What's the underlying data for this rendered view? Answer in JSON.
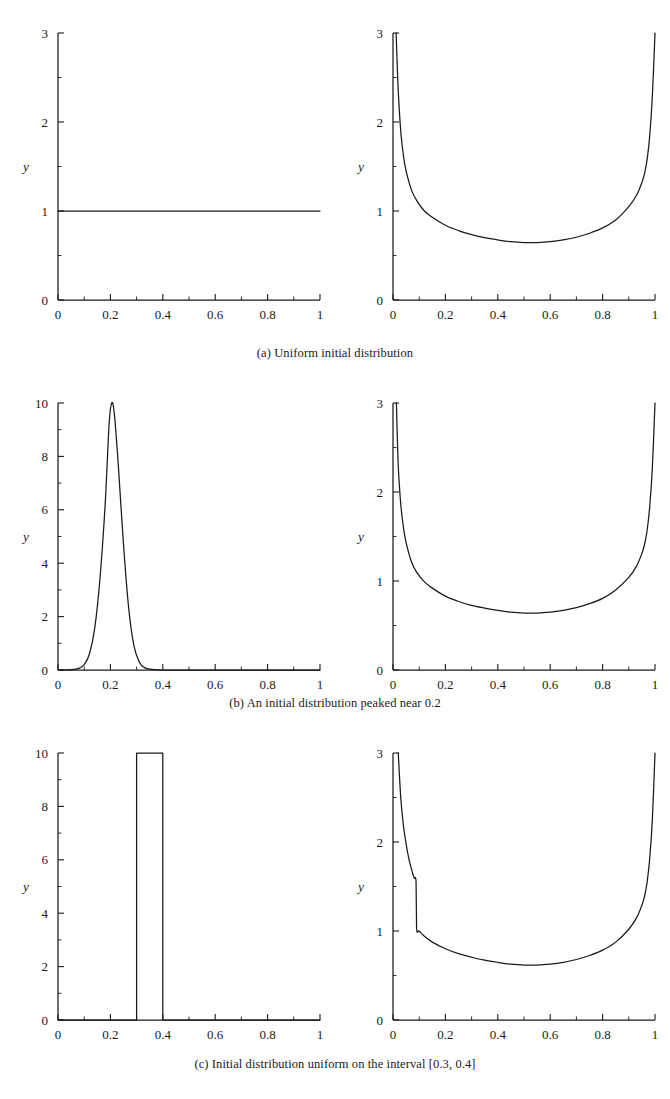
{
  "figure": {
    "axis_label_x": "x",
    "axis_label_y": "y",
    "rows": [
      {
        "id": "a",
        "caption": "(a) Uniform initial distribution"
      },
      {
        "id": "b",
        "caption": "(b) An initial distribution peaked near 0.2"
      },
      {
        "id": "c",
        "caption": "(c) Initial distribution uniform on the interval [0.3, 0.4]"
      }
    ]
  },
  "chart_data": [
    {
      "type": "line",
      "panel": "a-left",
      "title": "",
      "xlabel": "x",
      "ylabel": "y",
      "xlim": [
        0,
        1
      ],
      "ylim": [
        0,
        3
      ],
      "xticks": [
        0,
        0.2,
        0.4,
        0.6,
        0.8,
        1
      ],
      "xtick_labels": [
        "0",
        "0.2",
        "0.4",
        "0.6",
        "0.8",
        "1"
      ],
      "yticks": [
        0,
        1,
        2,
        3
      ],
      "ytick_labels": [
        "0",
        "1",
        "2",
        "3"
      ],
      "x_minor_step": 0.1,
      "y_minor_step": 0.5,
      "grid": false,
      "legend": "none",
      "series": [
        {
          "name": "uniform initial density",
          "x": [
            0,
            0.1,
            0.2,
            0.3,
            0.4,
            0.5,
            0.6,
            0.7,
            0.8,
            0.9,
            1
          ],
          "values": [
            1,
            1,
            1,
            1,
            1,
            1,
            1,
            1,
            1,
            1,
            1
          ]
        }
      ]
    },
    {
      "type": "line",
      "panel": "a-right",
      "title": "",
      "xlabel": "x",
      "ylabel": "y",
      "xlim": [
        0,
        1
      ],
      "ylim": [
        0,
        3
      ],
      "xticks": [
        0,
        0.2,
        0.4,
        0.6,
        0.8,
        1
      ],
      "xtick_labels": [
        "0",
        "0.2",
        "0.4",
        "0.6",
        "0.8",
        "1"
      ],
      "yticks": [
        0,
        1,
        2,
        3
      ],
      "ytick_labels": [
        "0",
        "1",
        "2",
        "3"
      ],
      "x_minor_step": 0.1,
      "y_minor_step": 0.5,
      "grid": false,
      "legend": "none",
      "series": [
        {
          "name": "limiting arcsine-type density",
          "x": [
            0.012,
            0.02,
            0.03,
            0.04,
            0.05,
            0.07,
            0.09,
            0.12,
            0.15,
            0.2,
            0.25,
            0.3,
            0.35,
            0.4,
            0.45,
            0.5,
            0.55,
            0.6,
            0.65,
            0.7,
            0.75,
            0.8,
            0.85,
            0.9,
            0.93,
            0.95,
            0.96,
            0.97,
            0.98,
            0.99,
            1.0
          ],
          "values": [
            3.0,
            2.35,
            1.88,
            1.62,
            1.45,
            1.24,
            1.12,
            1.0,
            0.93,
            0.84,
            0.78,
            0.735,
            0.7,
            0.675,
            0.655,
            0.645,
            0.645,
            0.655,
            0.675,
            0.705,
            0.75,
            0.81,
            0.9,
            1.05,
            1.18,
            1.32,
            1.42,
            1.58,
            1.85,
            2.3,
            3.0
          ]
        }
      ]
    },
    {
      "type": "line",
      "panel": "b-left",
      "title": "",
      "xlabel": "x",
      "ylabel": "y",
      "xlim": [
        0,
        1
      ],
      "ylim": [
        0,
        10
      ],
      "xticks": [
        0,
        0.2,
        0.4,
        0.6,
        0.8,
        1
      ],
      "xtick_labels": [
        "0",
        "0.2",
        "0.4",
        "0.6",
        "0.8",
        "1"
      ],
      "yticks": [
        0,
        2,
        4,
        6,
        8,
        10
      ],
      "ytick_labels": [
        "0",
        "2",
        "4",
        "6",
        "8",
        "10"
      ],
      "x_minor_step": 0.1,
      "y_minor_step": 1,
      "grid": false,
      "legend": "none",
      "peak_center": 0.205,
      "peak_height": 10,
      "peak_sigma": 0.04,
      "series": [
        {
          "name": "initial density peaked near 0.2",
          "x": [
            0,
            0.05,
            0.08,
            0.1,
            0.12,
            0.14,
            0.16,
            0.18,
            0.195,
            0.205,
            0.215,
            0.23,
            0.25,
            0.27,
            0.29,
            0.31,
            0.33,
            0.36,
            0.4,
            0.5,
            0.7,
            1.0
          ],
          "values": [
            0,
            0.01,
            0.06,
            0.2,
            0.6,
            1.55,
            3.4,
            6.2,
            9.2,
            10.0,
            9.6,
            7.7,
            4.7,
            2.3,
            0.9,
            0.3,
            0.09,
            0.02,
            0.0,
            0.0,
            0.0,
            0.0
          ]
        }
      ]
    },
    {
      "type": "line",
      "panel": "b-right",
      "title": "",
      "xlabel": "x",
      "ylabel": "y",
      "xlim": [
        0,
        1
      ],
      "ylim": [
        0,
        3
      ],
      "xticks": [
        0,
        0.2,
        0.4,
        0.6,
        0.8,
        1
      ],
      "xtick_labels": [
        "0",
        "0.2",
        "0.4",
        "0.6",
        "0.8",
        "1"
      ],
      "yticks": [
        0,
        1,
        2,
        3
      ],
      "ytick_labels": [
        "0",
        "1",
        "2",
        "3"
      ],
      "x_minor_step": 0.1,
      "y_minor_step": 0.5,
      "grid": false,
      "legend": "none",
      "series": [
        {
          "name": "limiting arcsine-type density",
          "x": [
            0.013,
            0.02,
            0.03,
            0.04,
            0.05,
            0.07,
            0.09,
            0.12,
            0.15,
            0.2,
            0.25,
            0.3,
            0.35,
            0.4,
            0.45,
            0.5,
            0.55,
            0.6,
            0.65,
            0.7,
            0.75,
            0.8,
            0.85,
            0.9,
            0.93,
            0.95,
            0.96,
            0.97,
            0.98,
            0.99,
            1.0
          ],
          "values": [
            3.0,
            2.3,
            1.85,
            1.6,
            1.43,
            1.22,
            1.1,
            0.99,
            0.92,
            0.83,
            0.77,
            0.725,
            0.695,
            0.67,
            0.65,
            0.64,
            0.64,
            0.65,
            0.67,
            0.7,
            0.745,
            0.805,
            0.9,
            1.04,
            1.17,
            1.31,
            1.41,
            1.57,
            1.84,
            2.28,
            3.0
          ]
        }
      ]
    },
    {
      "type": "line",
      "panel": "c-left",
      "title": "",
      "xlabel": "x",
      "ylabel": "y",
      "xlim": [
        0,
        1
      ],
      "ylim": [
        0,
        10
      ],
      "xticks": [
        0,
        0.2,
        0.4,
        0.6,
        0.8,
        1
      ],
      "xtick_labels": [
        "0",
        "0.2",
        "0.4",
        "0.6",
        "0.8",
        "1"
      ],
      "yticks": [
        0,
        2,
        4,
        6,
        8,
        10
      ],
      "ytick_labels": [
        "0",
        "2",
        "4",
        "6",
        "8",
        "10"
      ],
      "x_minor_step": 0.1,
      "y_minor_step": 1,
      "grid": false,
      "legend": "none",
      "pulse_interval": [
        0.3,
        0.4
      ],
      "pulse_height": 10,
      "series": [
        {
          "name": "uniform density on [0.3, 0.4]",
          "x": [
            0,
            0.3,
            0.3,
            0.4,
            0.4,
            1.0
          ],
          "values": [
            0,
            0,
            10,
            10,
            0,
            0
          ]
        }
      ]
    },
    {
      "type": "line",
      "panel": "c-right",
      "title": "",
      "xlabel": "x",
      "ylabel": "y",
      "xlim": [
        0,
        1
      ],
      "ylim": [
        0,
        3
      ],
      "xticks": [
        0,
        0.2,
        0.4,
        0.6,
        0.8,
        1
      ],
      "xtick_labels": [
        "0",
        "0.2",
        "0.4",
        "0.6",
        "0.8",
        "1"
      ],
      "yticks": [
        0,
        1,
        2,
        3
      ],
      "ytick_labels": [
        "0",
        "1",
        "2",
        "3"
      ],
      "x_minor_step": 0.1,
      "y_minor_step": 0.5,
      "grid": false,
      "legend": "none",
      "discontinuity_x": 0.09,
      "discontinuity_from": 1.55,
      "discontinuity_to": 1.03,
      "series": [
        {
          "name": "limiting density with jump at 0.09",
          "x": [
            0.02,
            0.03,
            0.04,
            0.05,
            0.06,
            0.07,
            0.08,
            0.088,
            0.09,
            0.1,
            0.12,
            0.15,
            0.2,
            0.25,
            0.3,
            0.35,
            0.4,
            0.45,
            0.5,
            0.55,
            0.6,
            0.65,
            0.7,
            0.75,
            0.8,
            0.85,
            0.9,
            0.93,
            0.95,
            0.96,
            0.97,
            0.98,
            0.99,
            1.0
          ],
          "values": [
            3.0,
            2.48,
            2.18,
            1.98,
            1.82,
            1.7,
            1.6,
            1.55,
            1.03,
            1.0,
            0.94,
            0.875,
            0.8,
            0.745,
            0.705,
            0.672,
            0.648,
            0.628,
            0.617,
            0.617,
            0.628,
            0.648,
            0.68,
            0.725,
            0.785,
            0.875,
            1.02,
            1.15,
            1.29,
            1.39,
            1.55,
            1.82,
            2.26,
            3.0
          ]
        }
      ]
    }
  ]
}
